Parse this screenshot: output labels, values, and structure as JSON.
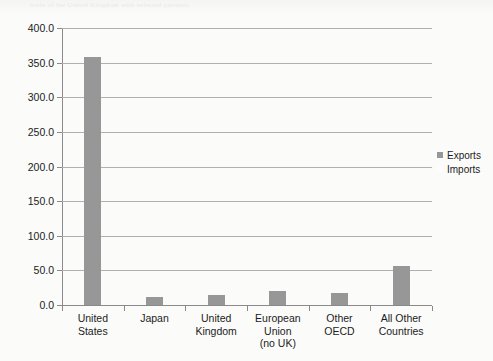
{
  "ghost_text": "trade  of  the  United  Kingdom  with  selected  partners",
  "chart_data": {
    "type": "bar",
    "title": "",
    "subtitle": "",
    "xlabel": "",
    "ylabel": "",
    "ylim": [
      0.0,
      400.0
    ],
    "ytick_step": 50.0,
    "ytick_labels": [
      "400.0",
      "350.0",
      "300.0",
      "250.0",
      "200.0",
      "150.0",
      "100.0",
      "50.0",
      "0.0"
    ],
    "ytick_values": [
      400.0,
      350.0,
      300.0,
      250.0,
      200.0,
      150.0,
      100.0,
      50.0,
      0.0
    ],
    "grid": true,
    "grid_axis": "y",
    "legend_position": "right",
    "categories": [
      "United\nStates",
      "Japan",
      "United\nKingdom",
      "European\nUnion\n(no UK)",
      "Other\nOECD",
      "All Other\nCountries"
    ],
    "series": [
      {
        "name": "Exports",
        "color": "#979797",
        "values": [
          358.0,
          11.0,
          14.0,
          20.0,
          18.0,
          57.0
        ]
      },
      {
        "name": "Imports",
        "color": "#fdfdfd",
        "values": [
          null,
          null,
          null,
          null,
          null,
          null
        ]
      }
    ],
    "legend": [
      {
        "label": "Exports",
        "swatch": "#979797"
      },
      {
        "label": "Imports",
        "swatch": "#fdfdfd"
      }
    ]
  }
}
